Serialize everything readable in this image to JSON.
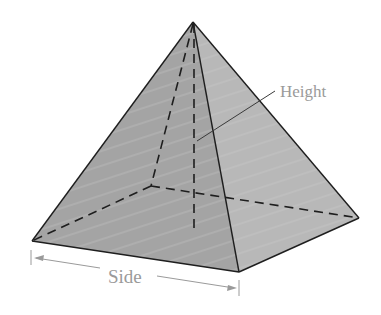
{
  "diagram": {
    "labels": {
      "height": "Height",
      "side": "Side"
    },
    "colors": {
      "left_face": "#a4a4a4",
      "right_face": "#b6b6b6",
      "edges": "#1e1e1e",
      "label_text": "#9a9a9a",
      "dimension_line": "#9a9a9a"
    },
    "vertices": {
      "apex": [
        193,
        22
      ],
      "base_left": [
        32,
        241
      ],
      "base_front": [
        239,
        272
      ],
      "base_right": [
        359,
        218
      ],
      "base_back_hidden": [
        151,
        186
      ],
      "height_foot": [
        194,
        229
      ]
    }
  }
}
